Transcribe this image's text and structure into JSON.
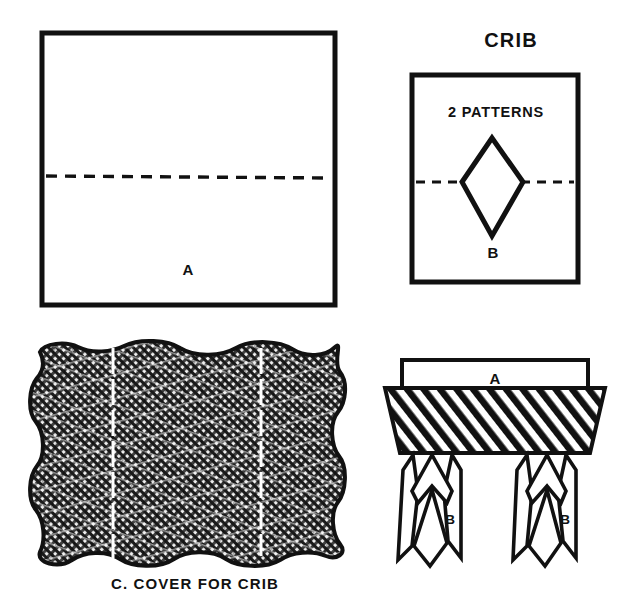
{
  "page": {
    "title": "CRIB",
    "background_color": "#ffffff",
    "ink_color": "#111111",
    "width": 640,
    "height": 612
  },
  "panels": {
    "pattern_a": {
      "name": "Pattern A sheet",
      "part_label": "A",
      "fold_line_style": "dashed",
      "shape": "square"
    },
    "pattern_b": {
      "name": "Pattern B sheet",
      "heading": "2 PATTERNS",
      "part_label": "B",
      "fold_line_style": "dashed",
      "shape": "diamond"
    },
    "cover": {
      "name": "Cover for crib",
      "caption": "C. COVER FOR CRIB",
      "texture": "cross-hatch fabric",
      "fold_line_style": "dashed",
      "fold_line_color": "#ffffff",
      "fold_lines": 2
    },
    "assembly": {
      "name": "Assembled crib",
      "top_part_label": "A",
      "leg_left_label": "B",
      "leg_right_label": "B",
      "body_fill": "diagonal-hatch"
    }
  }
}
